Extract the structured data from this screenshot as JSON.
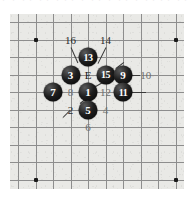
{
  "figure": {
    "kind": "go-board-diagram",
    "title": "",
    "board": {
      "columns": 10,
      "rows": 10,
      "grid_spacing_px": 17.5,
      "line_color": "#8d8d8d",
      "background_color": "#e9e9e6",
      "star_points": [
        {
          "col": 1,
          "row": 1
        },
        {
          "col": 9,
          "row": 1
        },
        {
          "col": 1,
          "row": 9
        },
        {
          "col": 9,
          "row": 9
        }
      ]
    },
    "stones": [
      {
        "label": "13",
        "color": "black",
        "col": 4,
        "row": 2
      },
      {
        "label": "3",
        "color": "black",
        "col": 3,
        "row": 3
      },
      {
        "label": "15",
        "color": "black",
        "col": 5,
        "row": 3
      },
      {
        "label": "9",
        "color": "black",
        "col": 6,
        "row": 3
      },
      {
        "label": "7",
        "color": "black",
        "col": 2,
        "row": 4
      },
      {
        "label": "1",
        "color": "black",
        "col": 4,
        "row": 4
      },
      {
        "label": "11",
        "color": "black",
        "col": 6,
        "row": 4
      },
      {
        "label": "5",
        "color": "black",
        "col": 4,
        "row": 5
      }
    ],
    "point_labels": [
      {
        "text": "16",
        "col": 3,
        "row": 1,
        "style": "plain"
      },
      {
        "text": "14",
        "col": 5,
        "row": 1,
        "style": "plain"
      },
      {
        "text": "E",
        "col": 4,
        "row": 3,
        "style": "letter"
      },
      {
        "text": "10",
        "col": 7.3,
        "row": 3,
        "style": "faded"
      },
      {
        "text": "8",
        "col": 3,
        "row": 4,
        "style": "faded"
      },
      {
        "text": "12",
        "col": 5,
        "row": 4,
        "style": "faded"
      },
      {
        "text": "2",
        "col": 3,
        "row": 5,
        "style": "plain"
      },
      {
        "text": "4",
        "col": 5,
        "row": 5,
        "style": "faded"
      },
      {
        "text": "6",
        "col": 4,
        "row": 6,
        "style": "faded"
      }
    ],
    "scan_artifact_text": "・ ・   ・・ ・・  ・・・ ・ ・・  ・ ・・ ・  ・・・・ ・・・"
  }
}
